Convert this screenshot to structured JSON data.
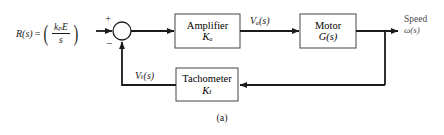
{
  "figure": {
    "caption": "(a)",
    "type": "control-system-block-diagram"
  },
  "input": {
    "name": "R(s)",
    "equals": "=",
    "numerator": "kₚE",
    "denominator": "s"
  },
  "summing_junction": {
    "plus": "+",
    "minus": "−"
  },
  "blocks": [
    {
      "id": "amplifier",
      "title": "Amplifier",
      "gain": "Kₐ"
    },
    {
      "id": "motor",
      "title": "Motor",
      "gain": "G(s)"
    },
    {
      "id": "tachometer",
      "title": "Tachometer",
      "gain": "Kₜ"
    }
  ],
  "signals": {
    "amplifier_output": "Vₐ(s)",
    "feedback": "Vₜ(s)"
  },
  "output": {
    "label": "Speed",
    "variable": "ω(s)"
  },
  "colors": {
    "line": "#1a1a1a",
    "block_border": "#555555",
    "text": "#1a1a1a",
    "muted_text": "#4a4a4a",
    "background": "#ffffff"
  }
}
